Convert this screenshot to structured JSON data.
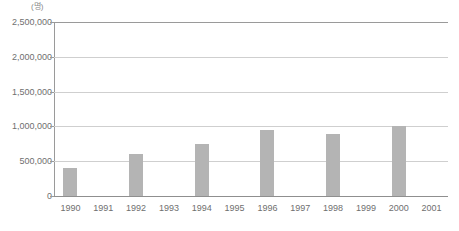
{
  "chart_data": {
    "type": "bar",
    "title": "",
    "subtitle": "",
    "xlabel": "",
    "ylabel": "",
    "unit_label": "(명)",
    "categories": [
      "1990",
      "1991",
      "1992",
      "1993",
      "1994",
      "1995",
      "1996",
      "1997",
      "1998",
      "1999",
      "2000",
      "2001"
    ],
    "values": [
      400000,
      null,
      600000,
      null,
      750000,
      null,
      950000,
      null,
      890000,
      null,
      1000000,
      null
    ],
    "ylim": [
      0,
      2500000
    ],
    "y_ticks": [
      0,
      500000,
      1000000,
      1500000,
      2000000,
      2500000
    ],
    "y_tick_labels": [
      "0",
      "500,000",
      "1,000,000",
      "1,500,000",
      "2,000,000",
      "2,500,000"
    ],
    "grid": true,
    "legend": false,
    "bar_color": "#b4b4b4",
    "gridline_color": "#cfcfcf",
    "axis_color": "#9a9a9a",
    "text_color": "#6f6f6f"
  }
}
